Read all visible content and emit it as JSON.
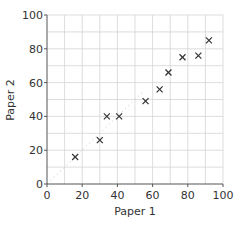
{
  "chart_data": {
    "type": "scatter",
    "title": "",
    "xlabel": "Paper 1",
    "ylabel": "Paper 2",
    "xlim": [
      0,
      100
    ],
    "ylim": [
      0,
      100
    ],
    "xticks": [
      0,
      20,
      40,
      60,
      80,
      100
    ],
    "yticks": [
      0,
      20,
      40,
      60,
      80,
      100
    ],
    "grid": true,
    "grid_step": 10,
    "marker": "x",
    "legend": null,
    "series": [
      {
        "name": "scores",
        "points": [
          {
            "x": 16,
            "y": 16
          },
          {
            "x": 30,
            "y": 26
          },
          {
            "x": 34,
            "y": 40
          },
          {
            "x": 41,
            "y": 40
          },
          {
            "x": 56,
            "y": 49
          },
          {
            "x": 64,
            "y": 56
          },
          {
            "x": 69,
            "y": 66
          },
          {
            "x": 77,
            "y": 75
          },
          {
            "x": 86,
            "y": 76
          },
          {
            "x": 92,
            "y": 85
          }
        ]
      }
    ],
    "annotations": [
      {
        "type": "faint-dashed-line",
        "from": {
          "x": 0,
          "y": 0
        },
        "to": {
          "x": 55,
          "y": 55
        }
      }
    ]
  },
  "labels": {
    "xlabel": "Paper 1",
    "ylabel": "Paper 2"
  }
}
